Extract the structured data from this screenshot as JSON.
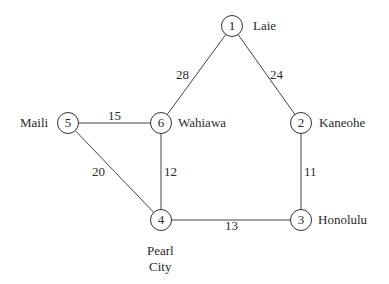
{
  "graph": {
    "nodes": [
      {
        "id": "1",
        "name": "Laie"
      },
      {
        "id": "2",
        "name": "Kaneohe"
      },
      {
        "id": "3",
        "name": "Honolulu"
      },
      {
        "id": "4",
        "name": "Pearl City",
        "name_line1": "Pearl",
        "name_line2": "City"
      },
      {
        "id": "5",
        "name": "Maili"
      },
      {
        "id": "6",
        "name": "Wahiawa"
      }
    ],
    "edges": [
      {
        "from": "1",
        "to": "6",
        "weight": "28"
      },
      {
        "from": "1",
        "to": "2",
        "weight": "24"
      },
      {
        "from": "5",
        "to": "6",
        "weight": "15"
      },
      {
        "from": "5",
        "to": "4",
        "weight": "20"
      },
      {
        "from": "6",
        "to": "4",
        "weight": "12"
      },
      {
        "from": "2",
        "to": "3",
        "weight": "11"
      },
      {
        "from": "4",
        "to": "3",
        "weight": "13"
      }
    ]
  }
}
